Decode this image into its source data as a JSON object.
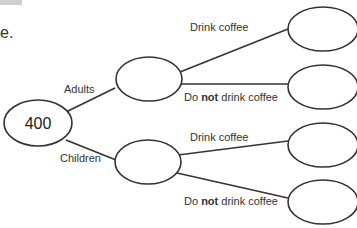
{
  "fragment_text": "e.",
  "root": {
    "value": "400"
  },
  "branches": {
    "level1": [
      {
        "label": "Adults"
      },
      {
        "label": "Children"
      }
    ],
    "level2": {
      "drink": "Drink coffee",
      "not_prefix": "Do ",
      "not_bold": "not",
      "not_suffix": " drink coffee"
    }
  },
  "colors": {
    "line": "#333333",
    "header_gray": "#cfcfcf"
  }
}
